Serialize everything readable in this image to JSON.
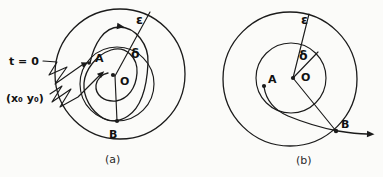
{
  "figure": {
    "paper_color": "#fbfbf9",
    "ink_color": "#1b1b1b",
    "caption_a": "(a)",
    "caption_b": "(b)",
    "diagram_a": {
      "description": "stable-trajectory-diagram",
      "labels": {
        "t0": "t = 0",
        "start_point": "(x₀ y₀)",
        "epsilon": "ε",
        "delta": "δ",
        "A": "A",
        "O": "O",
        "B": "B"
      }
    },
    "diagram_b": {
      "description": "unstable-trajectory-diagram",
      "labels": {
        "epsilon": "ε",
        "delta": "δ",
        "A": "A",
        "O": "O",
        "B": "B"
      }
    }
  }
}
